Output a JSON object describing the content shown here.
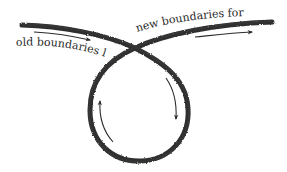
{
  "diagram": {
    "labels": {
      "left": "old boundaries lost",
      "right": "new boundaries formed"
    },
    "colors": {
      "stroke": "#1e1e1e",
      "arrow": "#2b2b2b",
      "text": "#2a2a2a",
      "background": "#ffffff"
    },
    "shapes": {
      "main_path": "loop-with-crossing",
      "direction_arrows": [
        "top-left-rightward",
        "top-right-rightward",
        "inner-left-upward",
        "inner-right-downward"
      ]
    }
  }
}
